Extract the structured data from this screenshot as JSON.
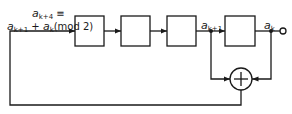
{
  "diagram": {
    "type": "linear-feedback-shift-register",
    "stages": 4,
    "labels": {
      "recurrence_line1": {
        "var": "a",
        "sub": "k+4",
        "rel": " ≡"
      },
      "recurrence_line2": {
        "var1": "a",
        "sub1": "k+1",
        "plus": " + ",
        "var2": "a",
        "sub2": "k",
        "mod": "(mod 2)"
      },
      "tap1": {
        "var": "a",
        "sub": "k+1"
      },
      "output": {
        "var": "a",
        "sub": "k"
      }
    },
    "xor_symbol": "+",
    "colors": {
      "line": "#1a1a1a",
      "background": "#ffffff"
    }
  }
}
